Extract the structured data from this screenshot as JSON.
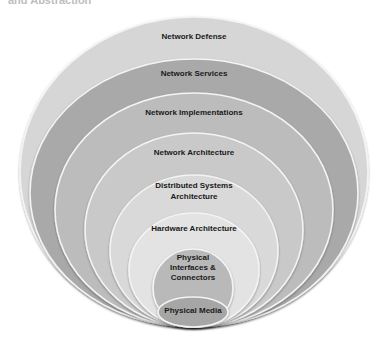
{
  "diagram": {
    "type": "nested-concentric-layers",
    "clipped_heading": "and Abstraction",
    "layers": [
      {
        "label": "Network Defense",
        "lines": [
          "Network Defense"
        ],
        "color": "#d6d6d6",
        "cx": 194,
        "cy": 172,
        "rx": 174,
        "ry": 155,
        "text_y": [
          39
        ]
      },
      {
        "label": "Network Services",
        "lines": [
          "Network Services"
        ],
        "color": "#a9a9a9",
        "cx": 194,
        "cy": 193,
        "rx": 164,
        "ry": 134,
        "text_y": [
          76
        ]
      },
      {
        "label": "Network Implementations",
        "lines": [
          "Network Implementations"
        ],
        "color": "#bcbcbc",
        "cx": 194,
        "cy": 210,
        "rx": 139,
        "ry": 117,
        "text_y": [
          115
        ]
      },
      {
        "label": "Network Architecture",
        "lines": [
          "Network Architecture"
        ],
        "color": "#c9c9c9",
        "cx": 194,
        "cy": 230,
        "rx": 109,
        "ry": 97,
        "text_y": [
          155
        ]
      },
      {
        "label": "Distributed Systems Architecture",
        "lines": [
          "Distributed Systems",
          "Architecture"
        ],
        "color": "#d9d9d9",
        "cx": 194,
        "cy": 251,
        "rx": 84,
        "ry": 76,
        "text_y": [
          188,
          199
        ]
      },
      {
        "label": "Hardware Architecture",
        "lines": [
          "Hardware Architecture"
        ],
        "color": "#e3e3e3",
        "cx": 194,
        "cy": 270,
        "rx": 65,
        "ry": 57,
        "text_y": [
          231
        ]
      },
      {
        "label": "Physical Interfaces & Connectors",
        "lines": [
          "Physical",
          "Interfaces &",
          "Connectors"
        ],
        "color": "#b9b9b9",
        "cx": 193,
        "cy": 288,
        "rx": 40,
        "ry": 39,
        "text_y": [
          260,
          270,
          280
        ]
      },
      {
        "label": "Physical Media",
        "lines": [
          "Physical Media"
        ],
        "color": "#a6a6a6",
        "cx": 193,
        "cy": 312,
        "rx": 35,
        "ry": 15,
        "text_y": [
          313
        ]
      }
    ]
  }
}
